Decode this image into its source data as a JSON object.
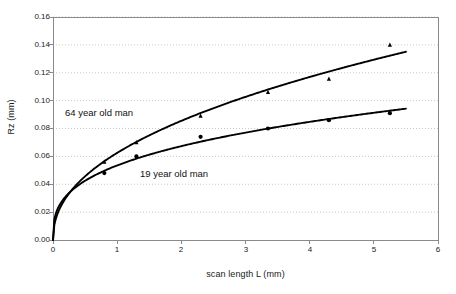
{
  "chart_data": {
    "type": "scatter",
    "title": "",
    "subtitle": "",
    "xlabel": "scan length L (mm)",
    "ylabel": "Rz (mm)",
    "xlim": [
      0,
      6
    ],
    "ylim": [
      0,
      0.16
    ],
    "xticks": [
      "0",
      "1",
      "2",
      "3",
      "4",
      "5",
      "6"
    ],
    "xtick_values": [
      0,
      1,
      2,
      3,
      4,
      5,
      6
    ],
    "yticks": [
      "0.00",
      "0.02",
      "0.04",
      "0.06",
      "0.08",
      "0.10",
      "0.12",
      "0.14",
      "0.16"
    ],
    "ytick_values": [
      0.0,
      0.02,
      0.04,
      0.06,
      0.08,
      0.1,
      0.12,
      0.14,
      0.16
    ],
    "grid": {
      "horizontal": true,
      "vertical": false,
      "style": "dotted",
      "color": "#c8c8c8"
    },
    "legend": {
      "position": "inline-annotation",
      "entries": [
        "64 year old man",
        "19 year old man"
      ]
    },
    "series": [
      {
        "name": "64 year old man",
        "marker": "triangle",
        "color": "#000000",
        "x": [
          0.8,
          1.3,
          2.3,
          3.35,
          4.3,
          5.25
        ],
        "values": [
          0.056,
          0.07,
          0.089,
          0.106,
          0.1155,
          0.14
        ],
        "fit": {
          "type": "power",
          "description": "Rz = a * L^b fitted curve through origin",
          "a": 0.0625,
          "b": 0.452,
          "x_start": 0.0,
          "x_end": 5.5,
          "y_end": 0.1355
        }
      },
      {
        "name": "19 year old man",
        "marker": "circle",
        "color": "#000000",
        "x": [
          0.8,
          1.3,
          2.3,
          3.35,
          4.3,
          5.25
        ],
        "values": [
          0.048,
          0.06,
          0.074,
          0.08,
          0.086,
          0.091
        ],
        "fit": {
          "type": "power",
          "description": "Rz = a * L^b fitted curve through origin",
          "a": 0.0535,
          "b": 0.332,
          "x_start": 0.0,
          "x_end": 5.5,
          "y_end": 0.0942
        }
      }
    ],
    "annotations": [
      {
        "text": "64 year old man",
        "x": 0.22,
        "y": 0.0975
      },
      {
        "text": "19 year old man",
        "x": 1.4,
        "y": 0.0545
      }
    ]
  },
  "axes": {
    "y_title": "Rz (mm)",
    "x_title": "scan length L (mm)"
  },
  "colors": {
    "background": "#ffffff",
    "frame": "#8a8a8a",
    "grid": "#c8c8c8",
    "data": "#000000",
    "text": "#1a1a1a"
  }
}
